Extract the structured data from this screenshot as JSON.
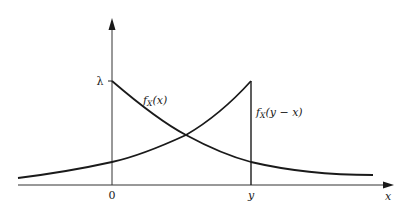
{
  "diagram": {
    "axes": {
      "x_axis_label": "x",
      "origin_label": "0",
      "y_tick_label": "y",
      "y_axis_value_label": "λ"
    },
    "curves": [
      {
        "name": "fX(x)",
        "label_main": "f",
        "label_sub": "X",
        "label_arg": "(x)"
      },
      {
        "name": "fX(y-x)",
        "label_main": "f",
        "label_sub": "X",
        "label_arg": "(y − x)"
      }
    ],
    "colors": {
      "stroke": "#1a1a1a",
      "axis": "#333333",
      "background": "#ffffff"
    }
  }
}
